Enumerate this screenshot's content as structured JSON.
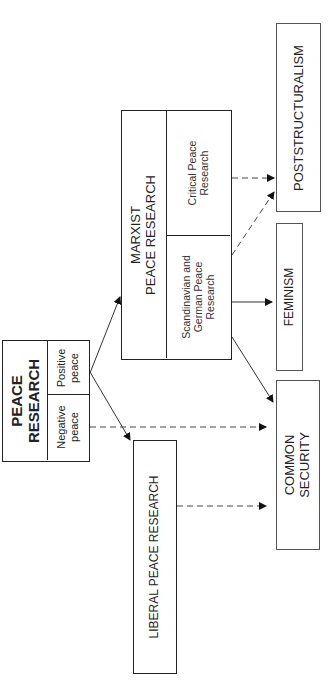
{
  "diagram": {
    "orientation": "rotated -90deg",
    "nodes": {
      "peace_research": {
        "title_line1": "PEACE",
        "title_line2": "RESEARCH",
        "cells": {
          "negative": {
            "line1": "Negative",
            "line2": "peace"
          },
          "positive": {
            "line1": "Positive",
            "line2": "peace"
          }
        }
      },
      "liberal": {
        "label": "LIBERAL PEACE RESEARCH"
      },
      "marxist": {
        "title_line1": "MARXIST",
        "title_line2": "PEACE RESEARCH",
        "cells": {
          "scandinavian": {
            "line1": "Scandinavian and",
            "line2": "German Peace",
            "line3": "Research"
          },
          "critical": {
            "line1": "Critical Peace",
            "line2": "Research"
          }
        }
      },
      "common_security": {
        "line1": "COMMON",
        "line2": "SECURITY"
      },
      "feminism": {
        "label": "FEMINISM"
      },
      "poststructuralism": {
        "label": "POSTSTRUCTURALISM"
      }
    },
    "edges": [
      {
        "from": "Positive peace",
        "to": "MARXIST PEACE RESEARCH",
        "style": "solid"
      },
      {
        "from": "Positive peace",
        "to": "LIBERAL PEACE RESEARCH",
        "style": "solid"
      },
      {
        "from": "Negative peace",
        "to": "COMMON SECURITY",
        "style": "dashed"
      },
      {
        "from": "LIBERAL PEACE RESEARCH",
        "to": "COMMON SECURITY",
        "style": "dashed"
      },
      {
        "from": "Scandinavian and German Peace Research",
        "to": "FEMINISM",
        "style": "solid"
      },
      {
        "from": "Scandinavian and German Peace Research",
        "to": "COMMON SECURITY",
        "style": "solid"
      },
      {
        "from": "Scandinavian and German Peace Research",
        "to": "POSTSTRUCTURALISM",
        "style": "dashed"
      },
      {
        "from": "Critical Peace Research",
        "to": "POSTSTRUCTURALISM",
        "style": "dashed"
      }
    ]
  }
}
